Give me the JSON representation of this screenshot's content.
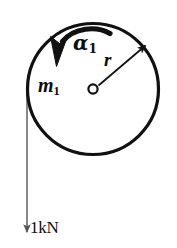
{
  "figure": {
    "background_color": "#ffffff",
    "stroke_color": "#111111",
    "rope_color": "#6b6b6b",
    "width": 177,
    "height": 248
  },
  "disk": {
    "name": "disk",
    "center_x": 93,
    "center_y": 89,
    "radius": 66,
    "hub_radius": 5,
    "stroke_width": 3
  },
  "labels": {
    "angular_acceleration": {
      "symbol": "α",
      "subscript": "1",
      "full": "α1"
    },
    "mass": {
      "symbol": "m",
      "subscript": "1",
      "full": "m1"
    },
    "radius": {
      "symbol": "r",
      "subscript": "",
      "full": "r"
    },
    "force": {
      "value": "1",
      "unit": "kN",
      "full": "1kN"
    }
  },
  "radius_arrow": {
    "name": "radius-arrow",
    "from_x": 98,
    "from_y": 85,
    "to_x": 146,
    "to_y": 45
  },
  "rotation_arrow": {
    "name": "rotation-arrow",
    "direction": "counterclockwise",
    "start_x": 110,
    "start_y": 32,
    "end_x": 54,
    "end_y": 62
  },
  "force_arrow": {
    "name": "force-arrow",
    "x": 27,
    "from_y": 89,
    "to_y": 238,
    "direction": "down"
  }
}
